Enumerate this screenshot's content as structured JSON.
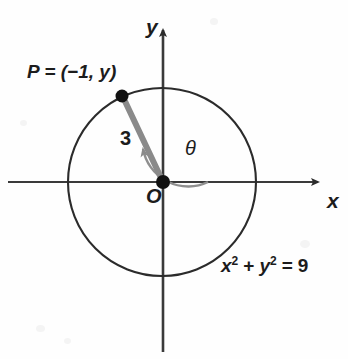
{
  "figure": {
    "background_color": "#fefefe",
    "width": 348,
    "height": 359
  },
  "axes": {
    "x_label": "x",
    "y_label": "y",
    "origin_label": "O",
    "axis_color": "#3a3a3a",
    "x_axis": {
      "start_x": 8,
      "end_x": 325,
      "y": 182
    },
    "y_axis": {
      "x": 163,
      "start_y": 22,
      "end_y": 352
    }
  },
  "circle": {
    "center_x": 162,
    "center_y": 182,
    "radius_px": 94,
    "stroke_color": "#2b2b2b",
    "equation": "x2 + y2 = 9",
    "equation_parts": {
      "x_base": "x",
      "x_exp": "2",
      "plus": "+",
      "y_base": "y",
      "y_exp": "2",
      "equals": "=",
      "value": "9"
    }
  },
  "point": {
    "label": "P = (−1, y)",
    "label_prefix": "P",
    "label_equals": "=",
    "label_coords": "(−1, y)",
    "x_value": -1,
    "y_value": "y",
    "px_x": 122,
    "px_y": 96,
    "marker_color": "#111111",
    "marker_radius": 6
  },
  "radius_segment": {
    "length_label": "3",
    "length_value": 3,
    "color": "#8a8a8a",
    "width_px": 6
  },
  "angle": {
    "label": "θ",
    "symbol": "theta",
    "arc_color": "#8a8a8a",
    "arc_radius_px": 46,
    "direction": "counterclockwise",
    "from_degrees": 0,
    "to_degrees": 150
  },
  "origin_marker": {
    "px_x": 163,
    "px_y": 182,
    "color": "#111111",
    "radius": 7
  }
}
